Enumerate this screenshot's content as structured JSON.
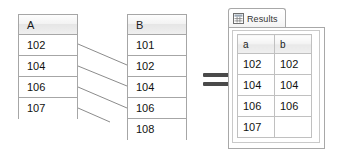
{
  "diagram": {
    "type": "left-outer-join-illustration",
    "equals_symbol": "=",
    "colors": {
      "border": "#a6a6a6",
      "header_gradient_top": "#fdfdfd",
      "header_gradient_bottom": "#e6e6e6",
      "line": "#8c8c8c",
      "text": "#111111",
      "equals": "#4a4a4a",
      "panel_border": "#a8a8a8"
    }
  },
  "table_a": {
    "name": "table-a",
    "header": "A",
    "rows": [
      "102",
      "104",
      "106",
      "107"
    ]
  },
  "table_b": {
    "name": "table-b",
    "header": "B",
    "rows": [
      "101",
      "102",
      "104",
      "106",
      "108"
    ]
  },
  "connectors": [
    {
      "from_value": "102",
      "to_value": "102"
    },
    {
      "from_value": "104",
      "to_value": "104"
    },
    {
      "from_value": "106",
      "to_value": "106"
    },
    {
      "from_value": "107",
      "to_value": null
    }
  ],
  "results": {
    "tab": {
      "label": "Results",
      "icon": "grid-icon"
    },
    "grid": {
      "columns": [
        "a",
        "b"
      ],
      "rows": [
        [
          "102",
          "102"
        ],
        [
          "104",
          "104"
        ],
        [
          "106",
          "106"
        ],
        [
          "107",
          ""
        ]
      ]
    }
  }
}
